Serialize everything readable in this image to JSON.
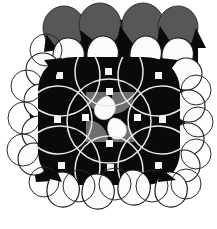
{
  "figure": {
    "width": 217,
    "height": 229,
    "background_color": "#ffffff"
  },
  "palette": {
    "background": "#ffffff",
    "dark": "#0a0a0a",
    "gray_top_sphere": "#575757",
    "gray_center_square": "#6e6e6e",
    "white_sphere": "#fbfbfb",
    "outline_dark": "#1a1a1a",
    "outline_light": "#e8e8e8",
    "shadow_gray": "#9a9a9a"
  },
  "geometry": {
    "lattice_step": 44,
    "lattice_origin_x": 42,
    "lattice_origin_y": 58,
    "core_rect": {
      "x": 38,
      "y": 57,
      "width": 142,
      "height": 128
    },
    "arc_circle_radius": 40,
    "arc_stroke_width": 1.6
  },
  "elements": {
    "top_gray_spheres": [
      {
        "cx": 64,
        "cy": 28,
        "rx": 21,
        "ry": 22
      },
      {
        "cx": 100,
        "cy": 25,
        "rx": 21,
        "ry": 22
      },
      {
        "cx": 143,
        "cy": 25,
        "rx": 21,
        "ry": 22
      },
      {
        "cx": 178,
        "cy": 27,
        "rx": 20,
        "ry": 21
      }
    ],
    "white_spheres_row_top": [
      {
        "cx": 68,
        "cy": 54,
        "r": 16
      },
      {
        "cx": 101,
        "cy": 52,
        "r": 16
      },
      {
        "cx": 144,
        "cy": 52,
        "r": 16
      },
      {
        "cx": 175,
        "cy": 54,
        "r": 16
      }
    ],
    "white_spheres_left": [
      {
        "cx": 41,
        "cy": 72,
        "r": 17
      },
      {
        "cx": 41,
        "cy": 100,
        "r": 17
      },
      {
        "cx": 39,
        "cy": 134,
        "r": 17
      },
      {
        "cx": 34,
        "cy": 155,
        "r": 17
      }
    ],
    "white_spheres_right": [
      {
        "cx": 184,
        "cy": 73,
        "r": 16
      },
      {
        "cx": 190,
        "cy": 103,
        "r": 16
      },
      {
        "cx": 188,
        "cy": 136,
        "r": 16
      },
      {
        "cx": 184,
        "cy": 162,
        "r": 16
      }
    ],
    "white_spheres_bottom": [
      {
        "cx": 62,
        "cy": 190,
        "r": 17
      },
      {
        "cx": 96,
        "cy": 192,
        "r": 17
      },
      {
        "cx": 133,
        "cy": 188,
        "r": 17
      },
      {
        "cx": 168,
        "cy": 190,
        "r": 17
      }
    ],
    "center_gray_squares": [
      {
        "x": 87,
        "y": 93,
        "size": 22,
        "corner": "bottom-right"
      },
      {
        "x": 115,
        "y": 93,
        "size": 22,
        "corner": "bottom-left"
      },
      {
        "x": 87,
        "y": 121,
        "size": 22,
        "corner": "top-right"
      },
      {
        "x": 115,
        "y": 121,
        "size": 22,
        "corner": "top-left"
      }
    ],
    "center_white_lobes": [
      {
        "cx": 105,
        "cy": 110,
        "r": 11
      },
      {
        "cx": 120,
        "cy": 124,
        "r": 11
      }
    ],
    "lattice_nodes": [
      {
        "cx": 60,
        "cy": 76
      },
      {
        "cx": 108,
        "cy": 72
      },
      {
        "cx": 158,
        "cy": 76
      },
      {
        "cx": 58,
        "cy": 120
      },
      {
        "cx": 108,
        "cy": 118
      },
      {
        "cx": 162,
        "cy": 120
      },
      {
        "cx": 62,
        "cy": 166
      },
      {
        "cx": 110,
        "cy": 168
      },
      {
        "cx": 158,
        "cy": 166
      }
    ]
  },
  "labels": {
    "figure_caption": "",
    "alt_text": "Space-filling model of a crystal lattice showing overlapping dark, gray and white spheres"
  }
}
